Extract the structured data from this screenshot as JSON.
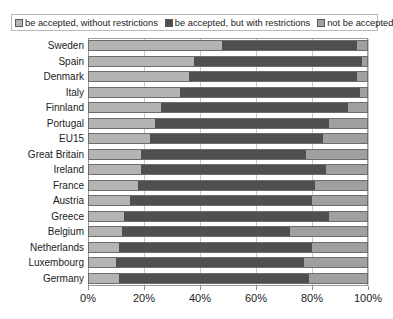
{
  "chart_data": {
    "type": "bar",
    "orientation": "horizontal",
    "stacked": true,
    "normalized_percent": true,
    "title": "",
    "subtitle": "",
    "xlabel": "",
    "ylabel": "",
    "xlim": [
      0,
      100
    ],
    "xticks": [
      "0%",
      "20%",
      "40%",
      "60%",
      "80%",
      "100%"
    ],
    "xtick_values": [
      0,
      20,
      40,
      60,
      80,
      100
    ],
    "grid": true,
    "grid_axis": "x",
    "legend_position": "top",
    "categories": [
      "Sweden",
      "Spain",
      "Denmark",
      "Italy",
      "Finnland",
      "Portugal",
      "EU15",
      "Great Britain",
      "Ireland",
      "France",
      "Austria",
      "Greece",
      "Belgium",
      "Netherlands",
      "Luxembourg",
      "Germany"
    ],
    "series": [
      {
        "name": "be accepted, without restrictions",
        "color": "#b4b4b4",
        "values": [
          48,
          38,
          36,
          33,
          26,
          24,
          22,
          19,
          19,
          18,
          15,
          13,
          12,
          11,
          10,
          11
        ]
      },
      {
        "name": "be accepted, but with restrictions",
        "color": "#4f4f4f",
        "values": [
          48,
          60,
          60,
          64,
          67,
          62,
          62,
          59,
          66,
          63,
          65,
          73,
          60,
          69,
          67,
          68
        ]
      },
      {
        "name": "not be accepted",
        "color": "#a0a0a0",
        "values": [
          4,
          2,
          4,
          3,
          7,
          14,
          16,
          22,
          15,
          19,
          20,
          14,
          28,
          20,
          23,
          21
        ]
      }
    ]
  },
  "legend": {
    "items": [
      {
        "label": "be accepted, without restrictions",
        "swatch": "#b4b4b4"
      },
      {
        "label": "be accepted, but with restrictions",
        "swatch": "#4f4f4f"
      },
      {
        "label": "not be accepted",
        "swatch": "#a0a0a0"
      }
    ]
  },
  "colors": {
    "background": "#ffffff",
    "plot_border": "#9a9a9a",
    "gridline": "#c6c6c6",
    "bar_outline": "#6d6d6d",
    "text": "#1b1b1b",
    "legend_border": "#b9b9b9"
  }
}
